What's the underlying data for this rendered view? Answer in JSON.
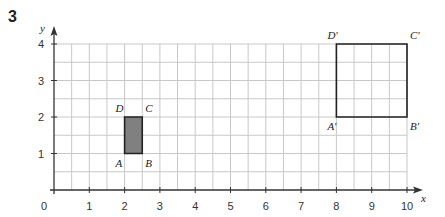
{
  "question_number": "3",
  "axes": {
    "x_label": "x",
    "y_label": "y",
    "origin_label": "0",
    "x_ticks": [
      "1",
      "2",
      "3",
      "4",
      "5",
      "6",
      "7",
      "8",
      "9",
      "10"
    ],
    "y_ticks": [
      "1",
      "2",
      "3",
      "4"
    ],
    "x_range": [
      0,
      10
    ],
    "y_range": [
      0,
      4
    ],
    "grid_step": 0.5
  },
  "shapes": {
    "original": {
      "name": "ABCD",
      "fill": "#808080",
      "vertices": [
        {
          "label": "A",
          "x": 2,
          "y": 1
        },
        {
          "label": "B",
          "x": 2.5,
          "y": 1
        },
        {
          "label": "C",
          "x": 2.5,
          "y": 2
        },
        {
          "label": "D",
          "x": 2,
          "y": 2
        }
      ]
    },
    "image": {
      "name": "A'B'C'D'",
      "fill": "none",
      "vertices": [
        {
          "label": "A'",
          "x": 8,
          "y": 2
        },
        {
          "label": "B'",
          "x": 10,
          "y": 2
        },
        {
          "label": "C'",
          "x": 10,
          "y": 4
        },
        {
          "label": "D'",
          "x": 8,
          "y": 4
        }
      ]
    }
  },
  "colors": {
    "grid": "#c8c8c8",
    "axis": "#333333",
    "outline": "#222222"
  }
}
